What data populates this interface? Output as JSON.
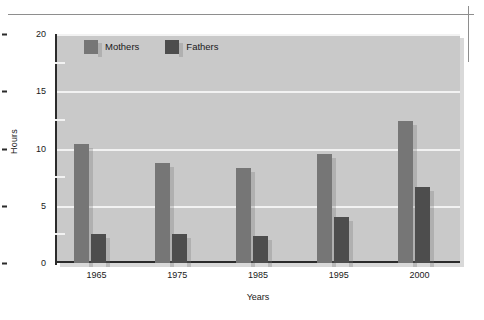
{
  "chart_data": {
    "type": "bar",
    "title": "",
    "xlabel": "Years",
    "ylabel": "Hours",
    "categories": [
      "1965",
      "1975",
      "1985",
      "1995",
      "2000"
    ],
    "series": [
      {
        "name": "Mothers",
        "color": "#767676",
        "values": [
          10.4,
          8.7,
          8.3,
          9.5,
          12.4
        ]
      },
      {
        "name": "Fathers",
        "color": "#4d4d4d",
        "values": [
          2.5,
          2.5,
          2.4,
          4.0,
          6.6
        ]
      }
    ],
    "ylim": [
      0,
      20
    ],
    "yticks": [
      "0",
      "5",
      "10",
      "15",
      "20"
    ],
    "ytick_values": [
      0,
      5,
      10,
      15,
      20
    ],
    "yminor_values": [
      2.5,
      7.5,
      12.5,
      17.5
    ],
    "grid": true,
    "grid_color": "#f2f2f2",
    "plot_background": "#c9c9c9",
    "legend_position": "top-left",
    "legend": [
      "Mothers",
      "Fathers"
    ]
  },
  "figure": {
    "page_background": "#ffffff",
    "rule_color": "#8e8e8e"
  }
}
